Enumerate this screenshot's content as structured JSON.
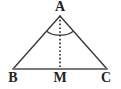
{
  "figure": {
    "background_color": "#ffffff",
    "stroke_color": "#3a3a3a",
    "baseline_color": "#7a7a7a",
    "label_color": "#222222",
    "width": 121,
    "height": 89
  },
  "labels": {
    "apex": "A",
    "left_base_vertex": "B",
    "base_midpoint": "M",
    "right_base_vertex": "C"
  },
  "points": {
    "A": {
      "x": 60,
      "y": 16
    },
    "B": {
      "x": 13,
      "y": 69
    },
    "M": {
      "x": 60,
      "y": 69
    },
    "C": {
      "x": 107,
      "y": 69
    }
  },
  "segments": [
    {
      "name": "side-ab",
      "from": "A",
      "to": "B",
      "style": "solid",
      "width": 1.4
    },
    {
      "name": "side-ac",
      "from": "A",
      "to": "C",
      "style": "solid",
      "width": 1.4
    },
    {
      "name": "base-bc",
      "from": "B",
      "to": "C",
      "style": "solid",
      "width": 1.8
    },
    {
      "name": "median-am",
      "from": "A",
      "to": "M",
      "style": "dotted",
      "width": 1.6
    }
  ],
  "angle_marks": {
    "description": "Two equal-angle arcs at apex A marking angle BAM equal to angle MAC",
    "count": 2,
    "radius": 19,
    "marks": [
      {
        "name": "angle-arc-bam",
        "side": "left"
      },
      {
        "name": "angle-arc-mac",
        "side": "right"
      }
    ]
  }
}
